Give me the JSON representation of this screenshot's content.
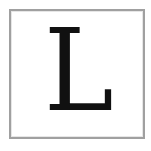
{
  "tile": {
    "letter": "L",
    "border_color": "#a0a0a0",
    "text_color": "#111111",
    "background_color": "#ffffff"
  }
}
